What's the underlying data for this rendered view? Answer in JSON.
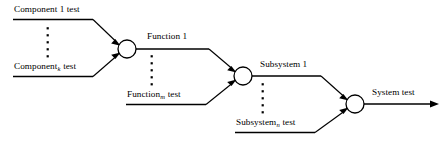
{
  "diagram": {
    "background_color": "#ffffff",
    "line_color": "#000000",
    "labels": {
      "component_1": {
        "base": "Component 1 test",
        "prefix": "Component 1 test",
        "sub": "",
        "suffix": ""
      },
      "component_k": {
        "base": "Component",
        "prefix": "Component",
        "sub": "k",
        "suffix": " test"
      },
      "function_1": {
        "base": "Function 1",
        "prefix": "Function 1",
        "sub": "",
        "suffix": ""
      },
      "function_m": {
        "base": "Function",
        "prefix": "Function",
        "sub": "m",
        "suffix": " test"
      },
      "subsystem_1": {
        "base": "Subsystem 1",
        "prefix": "Subsystem 1",
        "sub": "",
        "suffix": ""
      },
      "subsystem_n": {
        "base": "Subsystem",
        "prefix": "Subsystem",
        "sub": "n",
        "suffix": " test"
      },
      "system": {
        "base": "System test",
        "prefix": "System test",
        "sub": "",
        "suffix": ""
      }
    },
    "nodes": [
      {
        "name": "component-junction",
        "cx": 127,
        "cy": 49,
        "r": 9
      },
      {
        "name": "function-junction",
        "cx": 243,
        "cy": 76,
        "r": 9
      },
      {
        "name": "subsystem-junction",
        "cx": 355,
        "cy": 104,
        "r": 9
      }
    ],
    "ellipses": [
      {
        "name": "component-ellipsis",
        "x": 48,
        "y_start": 28,
        "y_end": 56,
        "count": 5
      },
      {
        "name": "function-ellipsis",
        "x": 152,
        "y_start": 56,
        "y_end": 84,
        "count": 5
      },
      {
        "name": "subsystem-ellipsis",
        "x": 263,
        "y_start": 84,
        "y_end": 112,
        "count": 5
      }
    ],
    "stages": [
      {
        "name": "component-stage",
        "inputs": [
          "Component 1 test",
          "Component k test"
        ],
        "output": "Function 1"
      },
      {
        "name": "function-stage",
        "inputs": [
          "Function 1",
          "Function m test"
        ],
        "output": "Subsystem 1"
      },
      {
        "name": "subsystem-stage",
        "inputs": [
          "Subsystem 1",
          "Subsystem n test"
        ],
        "output": "System test"
      }
    ]
  }
}
